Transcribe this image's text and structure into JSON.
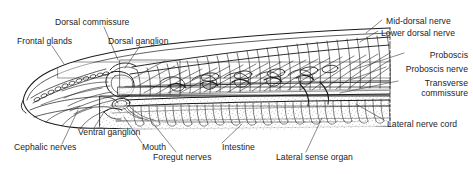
{
  "figure": {
    "background_color": "#ffffff",
    "ink_color": "#1a1a1a",
    "label_color": "#242424",
    "width": 473,
    "height": 174
  },
  "labels": {
    "dorsal_commissure": "Dorsal commissure",
    "frontal_glands": "Frontal glands",
    "dorsal_ganglion": "Dorsal ganglion",
    "mid_dorsal_nerve": "Mid-dorsal nerve",
    "lower_dorsal_nerve": "Lower dorsal nerve",
    "proboscis": "Proboscis",
    "proboscis_nerve": "Proboscis nerve",
    "transverse": "Transverse",
    "commissure": "commissure",
    "lateral_nerve_cord": "Lateral nerve cord",
    "ventral_ganglion": "Ventral ganglion",
    "cephalic_nerves": "Cephalic nerves",
    "mouth": "Mouth",
    "foregut_nerves": "Foregut nerves",
    "intestine": "Intestine",
    "lateral_sense_organ": "Lateral sense organ"
  }
}
